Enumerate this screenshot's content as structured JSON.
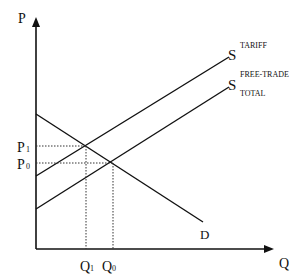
{
  "diagram": {
    "title": "",
    "axes": {
      "y_label": "P",
      "x_label": "Q"
    },
    "curves": {
      "demand": {
        "label": "D"
      },
      "supply_tariff": {
        "label": "S",
        "superscript": "TARIFF"
      },
      "supply_free_trade": {
        "label": "S",
        "superscript": "FREE-TRADE",
        "subscript": "TOTAL"
      }
    },
    "price_labels": {
      "p1": {
        "main": "P",
        "sub": "1"
      },
      "p0": {
        "main": "P",
        "sub": "0"
      }
    },
    "quantity_labels": {
      "q1": {
        "main": "Q",
        "sub": "1"
      },
      "q0": {
        "main": "Q",
        "sub": "0"
      }
    }
  }
}
